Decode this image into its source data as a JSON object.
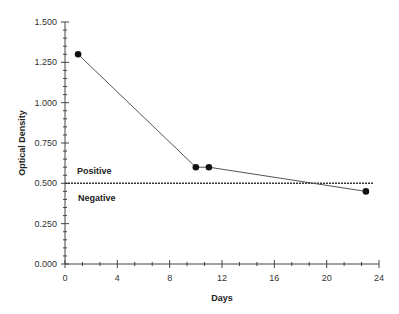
{
  "chart_data": {
    "type": "line",
    "title": "",
    "xlabel": "Days",
    "ylabel": "Optical Density",
    "xlim": [
      0,
      24
    ],
    "ylim": [
      0,
      1.5
    ],
    "x_ticks": [
      "0",
      "4",
      "8",
      "12",
      "16",
      "20",
      "24"
    ],
    "y_ticks": [
      "0.000",
      "0.250",
      "0.500",
      "0.750",
      "1.000",
      "1.250",
      "1.500"
    ],
    "grid": false,
    "series": [
      {
        "name": "Optical Density",
        "x": [
          1,
          10,
          11,
          23
        ],
        "values": [
          1.3,
          0.6,
          0.6,
          0.45
        ]
      }
    ],
    "reference_line": {
      "y": 0.5,
      "style": "dotted"
    },
    "annotations": [
      {
        "text": "Positive",
        "x": 1,
        "y": 0.56
      },
      {
        "text": "Negative",
        "x": 1,
        "y": 0.42
      }
    ]
  }
}
